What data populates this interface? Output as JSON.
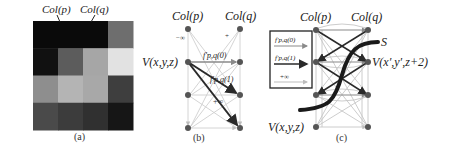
{
  "panel_a": {
    "caption": "(a)",
    "col_p_label": "Col(p)",
    "col_q_label": "Col(q)",
    "grid_rows": 4,
    "grid_cols": 4,
    "cell_colors": [
      [
        "#0a0a0a",
        "#0a0a0a",
        "#0a0a0a",
        "#6e6e6e"
      ],
      [
        "#111111",
        "#5c5c5c",
        "#a6a6a6",
        "#e2e2e2"
      ],
      [
        "#8e8e8e",
        "#b4b4b4",
        "#a8a8a8",
        "#3e3e3e"
      ],
      [
        "#4a4a4a",
        "#3c3c3c",
        "#303030",
        "#161616"
      ]
    ]
  },
  "panel_b": {
    "caption": "(b)",
    "col_p_label": "Col(p)",
    "col_q_label": "Col(q)",
    "vertex_label": "V(x,y,z)",
    "edge_label_0": "f′p,q(0)",
    "edge_label_1": "f′p,q(1)",
    "edge_label_inf": "+∞",
    "minus_inf_label": "−∞"
  },
  "panel_c": {
    "caption": "(c)",
    "col_p_label": "Col(p)",
    "col_q_label": "Col(q)",
    "surface_label": "S",
    "vertex_top_label": "V(x′,y′,z+2)",
    "vertex_bottom_label": "V(x,y,z)",
    "legend": {
      "item_0": "f′p,q(0)",
      "item_1": "f′p,q(1)",
      "item_inf": "+∞"
    }
  },
  "colors": {
    "light_edge": "#c8c8c8",
    "medium_edge": "#8a8a8a",
    "dark_edge": "#2a2a2a",
    "node": "#555555",
    "curve": "#1a1a1a"
  }
}
